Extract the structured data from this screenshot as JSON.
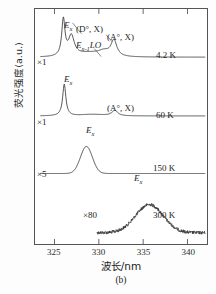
{
  "figure": {
    "panel_caption": "(b)",
    "xlabel": "波长/nm",
    "ylabel": "荧光强度(a.u.)"
  },
  "axes": {
    "xticks": [
      "325",
      "330",
      "335",
      "340"
    ],
    "xtick_values": [
      325,
      330,
      335,
      340
    ],
    "xlim": [
      322.8,
      342.2
    ],
    "ylim": [
      0,
      1
    ]
  },
  "annotations": {
    "mult_42k": "×1",
    "mult_60k": "×1",
    "mult_150k": "×5",
    "mult_300k": "×80",
    "temp_42k": "4.2 K",
    "temp_60k": "60 K",
    "temp_150k": "150 K",
    "temp_300k": "300 K",
    "ex_42k": "E",
    "ex_42k_sub": "x",
    "ex_60k": "E",
    "ex_60k_sub": "x",
    "ex_150k": "E",
    "ex_150k_sub": "x",
    "ex_300k": "E",
    "ex_300k_sub": "x",
    "donor_bound": "(D°, X)",
    "acceptor_bound_42k": "(A°, X)",
    "acceptor_bound_60k": "(A°, X)",
    "phonon_replica": "E",
    "phonon_replica_sub": "x-1",
    "phonon_replica_tail": "LO"
  },
  "chart_data": {
    "type": "line",
    "title": "",
    "xlabel": "波长/nm",
    "ylabel": "荧光强度(a.u.)",
    "xlim": [
      322.8,
      342.2
    ],
    "ylim": [
      0,
      1
    ],
    "grid": false,
    "legend": "none",
    "series": [
      {
        "name": "4.2 K",
        "scale_label": "×1",
        "baseline": 0.795,
        "peaks": [
          {
            "label": "Ex",
            "x": 326.0,
            "height": 0.155
          },
          {
            "label": "(D°, X)",
            "x": 326.9,
            "height": 0.085
          },
          {
            "label": "Ex-1LO",
            "x": 330.6,
            "height": 0.018
          },
          {
            "label": "(A°, X)",
            "x": 331.7,
            "height": 0.068
          }
        ],
        "annotations": [
          "Ex",
          "(D°, X)",
          "Ex-1LO",
          "(A°, X)",
          "4.2 K",
          "×1"
        ]
      },
      {
        "name": "60 K",
        "scale_label": "×1",
        "baseline": 0.545,
        "peaks": [
          {
            "label": "Ex",
            "x": 326.1,
            "height": 0.135
          },
          {
            "label": "(A°, X)",
            "x": 331.8,
            "height": 0.023
          }
        ],
        "annotations": [
          "Ex",
          "(A°, X)",
          "60 K",
          "×1"
        ]
      },
      {
        "name": "150 K",
        "scale_label": "×5",
        "baseline": 0.3,
        "peaks": [
          {
            "label": "Ex",
            "x": 328.6,
            "height": 0.115
          }
        ],
        "annotations": [
          "Ex",
          "150 K",
          "×5"
        ]
      },
      {
        "name": "300 K",
        "scale_label": "×80",
        "baseline": 0.048,
        "noisy": true,
        "xrange": [
          329.8,
          342.0
        ],
        "peaks": [
          {
            "label": "Ex",
            "x": 335.7,
            "height": 0.12
          }
        ],
        "annotations": [
          "Ex",
          "300 K",
          "×80"
        ]
      }
    ]
  }
}
